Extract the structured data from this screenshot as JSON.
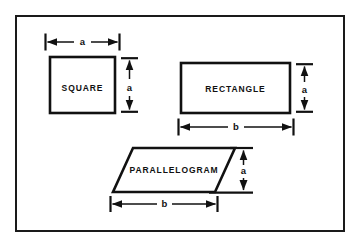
{
  "figure": {
    "name": "geometric-shapes-dimension-diagram",
    "background_color": "#ffffff",
    "line_color": "#111111",
    "border": {
      "name": "outer-frame",
      "x": 15,
      "y": 15,
      "width": 330,
      "height": 217,
      "stroke_width": 2
    }
  },
  "shapes": [
    {
      "id": "square",
      "label": "SQUARE",
      "type": "square",
      "outline_stroke_width": 2.6,
      "geometry": {
        "x": 50,
        "y": 57,
        "width": 65,
        "height": 56
      },
      "label_pos": {
        "x": 82.5,
        "y": 89
      },
      "dimensions": [
        {
          "id": "square-width",
          "label": "a",
          "orientation": "horizontal",
          "line": {
            "x1": 44,
            "y1": 42,
            "x2": 121,
            "y2": 42
          },
          "label_pos": {
            "x": 82.5,
            "y": 39
          }
        },
        {
          "id": "square-height",
          "label": "a",
          "orientation": "vertical",
          "line": {
            "x1": 129,
            "y1": 57,
            "x2": 129,
            "y2": 113
          },
          "label_pos": {
            "x": 126,
            "y": 88
          }
        }
      ]
    },
    {
      "id": "rectangle",
      "label": "RECTANGLE",
      "type": "rectangle",
      "outline_stroke_width": 2.6,
      "geometry": {
        "x": 181,
        "y": 63,
        "width": 109,
        "height": 50
      },
      "label_pos": {
        "x": 235.5,
        "y": 91
      },
      "dimensions": [
        {
          "id": "rectangle-height",
          "label": "a",
          "orientation": "vertical",
          "line": {
            "x1": 304,
            "y1": 63,
            "x2": 304,
            "y2": 113
          },
          "label_pos": {
            "x": 301,
            "y": 91
          }
        },
        {
          "id": "rectangle-width",
          "label": "b",
          "orientation": "horizontal",
          "line": {
            "x1": 176,
            "y1": 127,
            "x2": 296,
            "y2": 127
          },
          "label_pos": {
            "x": 236,
            "y": 124
          }
        }
      ]
    },
    {
      "id": "parallelogram",
      "label": "PARALLELOGRAM",
      "type": "parallelogram",
      "outline_stroke_width": 2.6,
      "geometry": {
        "points": "133,148 235,148 215,192 113,192",
        "top_y": 148,
        "bottom_y": 192
      },
      "label_pos": {
        "x": 174,
        "y": 172
      },
      "dimensions": [
        {
          "id": "parallelogram-height",
          "label": "a",
          "orientation": "vertical",
          "line": {
            "x1": 243,
            "y1": 148,
            "x2": 243,
            "y2": 192
          },
          "label_pos": {
            "x": 240,
            "y": 171
          }
        },
        {
          "id": "parallelogram-base",
          "label": "b",
          "orientation": "horizontal",
          "line": {
            "x1": 108,
            "y1": 204,
            "x2": 220,
            "y2": 204
          },
          "label_pos": {
            "x": 164,
            "y": 201
          }
        }
      ]
    }
  ],
  "text": {
    "square": "SQUARE",
    "rectangle": "RECTANGLE",
    "parallelogram": "PARALLELOGRAM",
    "dim_a": "a",
    "dim_b": "b"
  }
}
